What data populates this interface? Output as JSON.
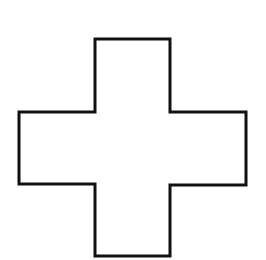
{
  "diagram": {
    "shape": "cross",
    "label": "Plus / cross outline",
    "stroke_color": "#111111",
    "fill_color": "#ffffff",
    "background_color": "#ffffff",
    "stroke_width": 3,
    "points": "95,39 170,39 170,112 246,112 246,185 170,185 170,256 95,256 95,184 19,184 19,112 95,112"
  }
}
